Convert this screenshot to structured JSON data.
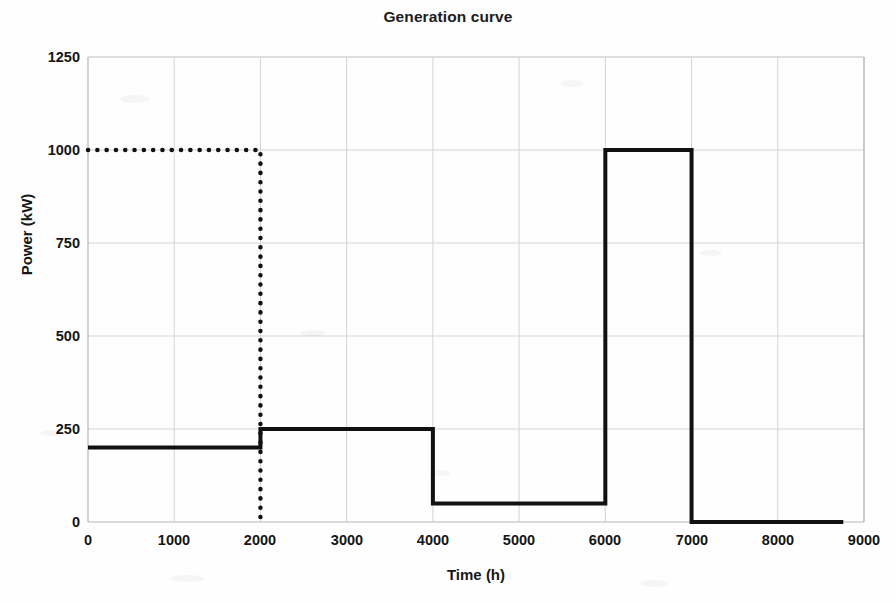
{
  "chart_data": {
    "type": "line",
    "title": "Generation curve",
    "xlabel": "Time (h)",
    "ylabel": "Power (kW)",
    "xlim": [
      0,
      9000
    ],
    "ylim": [
      0,
      1250
    ],
    "xticks": [
      0,
      1000,
      2000,
      3000,
      4000,
      5000,
      6000,
      7000,
      8000,
      9000
    ],
    "yticks": [
      0,
      250,
      500,
      750,
      1000,
      1250
    ],
    "xtick_labels": [
      "0",
      "1000",
      "2000",
      "3000",
      "4000",
      "5000",
      "6000",
      "7000",
      "8000",
      "9000"
    ],
    "ytick_labels": [
      "0",
      "250",
      "500",
      "750",
      "1000",
      "1250"
    ],
    "grid": true,
    "legend": false,
    "legend_position": "none",
    "series": [
      {
        "name": "generation-step-curve",
        "style": "solid",
        "color": "#111111",
        "linewidth": 4,
        "drawstyle": "steps-post",
        "x": [
          0,
          2000,
          2000,
          4000,
          4000,
          6000,
          6000,
          7000,
          7000,
          8760
        ],
        "y": [
          200,
          200,
          250,
          250,
          50,
          50,
          1000,
          1000,
          0,
          0
        ],
        "segments": [
          {
            "x_start": 0,
            "x_end": 2000,
            "value": 200
          },
          {
            "x_start": 2000,
            "x_end": 4000,
            "value": 250
          },
          {
            "x_start": 4000,
            "x_end": 6000,
            "value": 50
          },
          {
            "x_start": 6000,
            "x_end": 7000,
            "value": 1000
          },
          {
            "x_start": 7000,
            "x_end": 8760,
            "value": 0
          }
        ]
      },
      {
        "name": "rated-power-dotted",
        "style": "dotted",
        "color": "#111111",
        "linewidth": 4,
        "x": [
          0,
          2000,
          2000
        ],
        "y": [
          1000,
          1000,
          0
        ],
        "segments": [
          {
            "x_start": 0,
            "x_end": 2000,
            "value": 1000
          },
          {
            "x_at": 2000,
            "y_start": 1000,
            "y_end": 0,
            "orientation": "vertical"
          }
        ]
      }
    ]
  },
  "colors": {
    "line": "#111111",
    "grid": "#d4d4d4",
    "axis": "#b5b5b5",
    "background": "#fefefe",
    "text": "#161616"
  }
}
